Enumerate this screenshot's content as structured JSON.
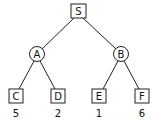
{
  "tree": {
    "root": {
      "label": "S",
      "shape": "square"
    },
    "level1": [
      {
        "label": "A",
        "shape": "circle"
      },
      {
        "label": "B",
        "shape": "circle"
      }
    ],
    "leaves": [
      {
        "label": "C",
        "shape": "square",
        "value": "5"
      },
      {
        "label": "D",
        "shape": "square",
        "value": "2"
      },
      {
        "label": "E",
        "shape": "square",
        "value": "1"
      },
      {
        "label": "F",
        "shape": "square",
        "value": "6"
      }
    ],
    "edges": [
      [
        "S",
        "A"
      ],
      [
        "S",
        "B"
      ],
      [
        "A",
        "C"
      ],
      [
        "A",
        "D"
      ],
      [
        "B",
        "E"
      ],
      [
        "B",
        "F"
      ]
    ]
  }
}
